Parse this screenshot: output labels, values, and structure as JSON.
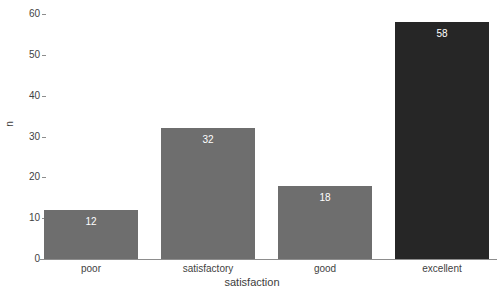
{
  "chart_data": {
    "type": "bar",
    "title": "",
    "subtitle": "",
    "categories": [
      "poor",
      "satisfactory",
      "good",
      "excellent"
    ],
    "values": [
      12,
      32,
      18,
      58
    ],
    "data_labels": [
      "12",
      "32",
      "18",
      "58"
    ],
    "xlabel": "satisfaction",
    "ylabel": "n",
    "ylim": [
      0,
      60
    ],
    "ytick_labels": [
      "0",
      "10",
      "20",
      "30",
      "40",
      "50",
      "60"
    ],
    "ytick_values": [
      0,
      10,
      20,
      30,
      40,
      50,
      60
    ],
    "grid": false,
    "legend": false,
    "bar_colors": [
      "#6e6e6e",
      "#6e6e6e",
      "#6e6e6e",
      "#262626"
    ],
    "background_color": "#ffffff",
    "axis_color": "#8d8d8d",
    "data_label_color": "#ffffff"
  }
}
